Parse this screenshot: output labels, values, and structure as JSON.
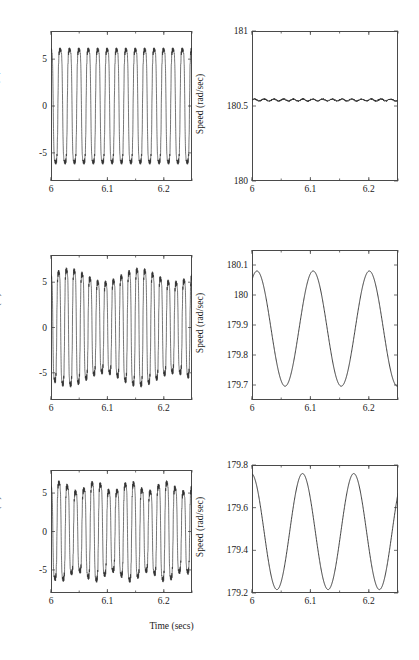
{
  "figure": {
    "background": "#ffffff",
    "axis_color": "#4a4a4a",
    "line_color": "#2b2b2b",
    "text_color": "#1a1a1a",
    "xlabel": "Time (secs)",
    "xtick_labels": [
      "6",
      "6.1",
      "6.2"
    ],
    "xticks": [
      6,
      6.1,
      6.2
    ],
    "xlim": [
      6,
      6.25
    ]
  },
  "chart_data": [
    {
      "type": "line",
      "panel": "top-left",
      "title": "",
      "xlabel": "",
      "ylabel": "Line Current (A)",
      "xlim": [
        6,
        6.25
      ],
      "ylim": [
        -8,
        8
      ],
      "xticks": [
        6,
        6.1,
        6.2
      ],
      "xtick_labels": [
        "6",
        "6.1",
        "6.2"
      ],
      "yticks": [
        -5,
        0,
        5
      ],
      "ytick_labels": [
        "-5",
        "0",
        "5"
      ],
      "grid": false,
      "legend": "none",
      "waveform": {
        "shape": "trapezoidal-ac",
        "frequency_hz": 60,
        "amplitude": 6.0,
        "amplitude_modulation": 0.0,
        "modulation_frequency_hz": 0,
        "flatness": 0.55,
        "ripple_amplitude": 0.35,
        "ripple_frequency_hz": 1080,
        "phase_deg": 95
      }
    },
    {
      "type": "line",
      "panel": "top-right",
      "title": "",
      "xlabel": "",
      "ylabel": "Speed (rad/sec)",
      "xlim": [
        6,
        6.25
      ],
      "ylim": [
        180,
        181
      ],
      "xticks": [
        6,
        6.1,
        6.2
      ],
      "xtick_labels": [
        "6",
        "6.1",
        "6.2"
      ],
      "yticks": [
        180,
        180.5,
        181
      ],
      "ytick_labels": [
        "180",
        "180.5",
        "181"
      ],
      "grid": false,
      "legend": "none",
      "waveform": {
        "shape": "steady-ripple",
        "mean": 180.54,
        "oscillation_amplitude": 0.0,
        "oscillation_frequency_hz": 0,
        "ripple_amplitude": 0.012,
        "ripple_frequency_hz": 60,
        "phase_deg": 0
      }
    },
    {
      "type": "line",
      "panel": "middle-left",
      "title": "",
      "xlabel": "",
      "ylabel": "Line Current (A)",
      "xlim": [
        6,
        6.25
      ],
      "ylim": [
        -8,
        8
      ],
      "xticks": [
        6,
        6.1,
        6.2
      ],
      "xtick_labels": [
        "6",
        "6.1",
        "6.2"
      ],
      "yticks": [
        -5,
        0,
        5
      ],
      "ytick_labels": [
        "-5",
        "0",
        "5"
      ],
      "grid": false,
      "legend": "none",
      "waveform": {
        "shape": "trapezoidal-ac",
        "frequency_hz": 72,
        "amplitude": 5.6,
        "amplitude_modulation": 0.13,
        "modulation_frequency_hz": 8,
        "flatness": 0.5,
        "ripple_amplitude": 0.45,
        "ripple_frequency_hz": 1080,
        "phase_deg": 95
      }
    },
    {
      "type": "line",
      "panel": "middle-right",
      "title": "",
      "xlabel": "",
      "ylabel": "Speed (rad/sec)",
      "xlim": [
        6,
        6.25
      ],
      "ylim": [
        179.65,
        180.15
      ],
      "xticks": [
        6,
        6.1,
        6.2
      ],
      "xtick_labels": [
        "6",
        "6.1",
        "6.2"
      ],
      "yticks": [
        179.7,
        179.8,
        179.9,
        180,
        180.1
      ],
      "ytick_labels": [
        "179.7",
        "179.8",
        "179.9",
        "180",
        "180.1"
      ],
      "grid": false,
      "legend": "none",
      "waveform": {
        "shape": "sinusoid",
        "mean": 179.888,
        "oscillation_amplitude": 0.192,
        "oscillation_frequency_hz": 10.4,
        "ripple_amplitude": 0.0,
        "ripple_frequency_hz": 0,
        "phase_deg": 58,
        "peak_value": 180.08,
        "trough_value": 179.695
      }
    },
    {
      "type": "line",
      "panel": "bottom-left",
      "title": "",
      "xlabel": "Time (secs)",
      "ylabel": "Line Cuurent (A)",
      "xlim": [
        6,
        6.25
      ],
      "ylim": [
        -8,
        8
      ],
      "xticks": [
        6,
        6.1,
        6.2
      ],
      "xtick_labels": [
        "6",
        "6.1",
        "6.2"
      ],
      "yticks": [
        -5,
        0,
        5
      ],
      "ytick_labels": [
        "-5",
        "0",
        "5"
      ],
      "grid": false,
      "legend": "none",
      "waveform": {
        "shape": "trapezoidal-ac",
        "frequency_hz": 68,
        "amplitude": 5.7,
        "amplitude_modulation": 0.11,
        "modulation_frequency_hz": 16,
        "flatness": 0.5,
        "ripple_amplitude": 0.5,
        "ripple_frequency_hz": 1080,
        "phase_deg": 100
      }
    },
    {
      "type": "line",
      "panel": "bottom-right",
      "title": "",
      "xlabel": "",
      "ylabel": "Speed (rad/sec)",
      "xlim": [
        6,
        6.25
      ],
      "ylim": [
        179.2,
        179.8
      ],
      "xticks": [
        6,
        6.1,
        6.2
      ],
      "xtick_labels": [
        "6",
        "6.1",
        "6.2"
      ],
      "yticks": [
        179.2,
        179.4,
        179.6,
        179.8
      ],
      "ytick_labels": [
        "179.2",
        "179.4",
        "179.6",
        "179.8"
      ],
      "grid": false,
      "legend": "none",
      "waveform": {
        "shape": "sinusoid",
        "mean": 179.488,
        "oscillation_amplitude": 0.272,
        "oscillation_frequency_hz": 11.4,
        "ripple_amplitude": 0.0,
        "ripple_frequency_hz": 0,
        "phase_deg": 95,
        "peak_value": 179.76,
        "trough_value": 179.215
      }
    }
  ]
}
